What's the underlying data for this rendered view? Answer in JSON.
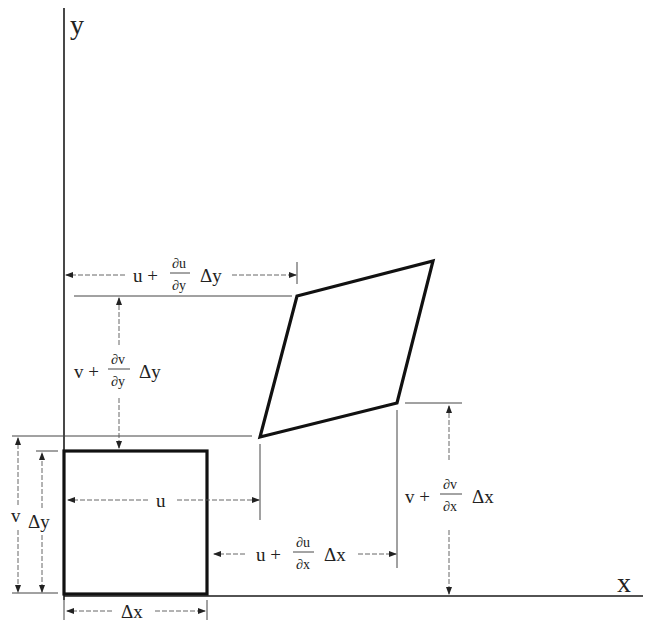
{
  "diagram": {
    "axes": {
      "x_label": "x",
      "y_label": "y"
    },
    "labels": {
      "u": "u",
      "v": "v",
      "dx": "Δx",
      "dy": "Δy",
      "u_plus": "u +",
      "v_plus": "v +",
      "du": "∂u",
      "dv": "∂v",
      "over_dx": "∂x",
      "over_dy": "∂y"
    },
    "annotations": [
      {
        "id": "top-u",
        "text": "u + (∂u/∂y) Δy"
      },
      {
        "id": "left-v",
        "text": "v + (∂v/∂y) Δy"
      },
      {
        "id": "mid-u",
        "text": "u"
      },
      {
        "id": "bottom-u",
        "text": "u + (∂u/∂x) Δx"
      },
      {
        "id": "right-v",
        "text": "v + (∂v/∂x) Δx"
      },
      {
        "id": "side-v",
        "text": "v"
      },
      {
        "id": "side-dy",
        "text": "Δy"
      },
      {
        "id": "bottom-dx",
        "text": "Δx"
      }
    ]
  }
}
